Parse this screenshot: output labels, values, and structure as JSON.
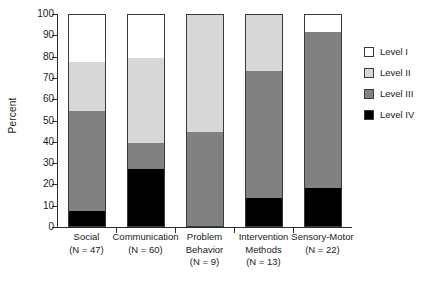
{
  "chart_data": {
    "type": "bar",
    "subtype": "stacked-bar-100",
    "title": "",
    "xlabel": "",
    "ylabel": "Percent",
    "ylim": [
      0,
      100
    ],
    "yticks": [
      0,
      10,
      20,
      30,
      40,
      50,
      60,
      70,
      80,
      90,
      100
    ],
    "grid": false,
    "legend_position": "right",
    "categories": [
      "Social",
      "Communication",
      "Problem Behavior",
      "Intervention Methods",
      "Sensory-Motor"
    ],
    "category_lines": [
      [
        "Social",
        "(N = 47)"
      ],
      [
        "Communication",
        "(N = 60)"
      ],
      [
        "Problem",
        "Behavior",
        "(N = 9)"
      ],
      [
        "Intervention",
        "Methods",
        "(N = 13)"
      ],
      [
        "Sensory-Motor",
        "(N = 22)"
      ]
    ],
    "category_counts": [
      47,
      60,
      9,
      13,
      22
    ],
    "series": [
      {
        "name": "Level I",
        "color": "#ffffff",
        "values": [
          23,
          21,
          0,
          0,
          9
        ]
      },
      {
        "name": "Level II",
        "color": "#d7d7d7",
        "values": [
          23,
          40,
          56,
          27,
          0
        ]
      },
      {
        "name": "Level III",
        "color": "#818181",
        "values": [
          47,
          12,
          44,
          60,
          73
        ]
      },
      {
        "name": "Level IV",
        "color": "#000000",
        "values": [
          7,
          27,
          0,
          13,
          18
        ]
      }
    ],
    "cumulative_tops": {
      "Level IV": [
        7,
        27,
        0,
        13,
        18
      ],
      "Level III": [
        54,
        39,
        44,
        73,
        91
      ],
      "Level II": [
        77,
        79,
        100,
        100,
        91
      ],
      "Level I": [
        100,
        100,
        100,
        100,
        100
      ]
    }
  },
  "legend": {
    "items": [
      {
        "label": "Level I",
        "swatch": "#ffffff"
      },
      {
        "label": "Level II",
        "swatch": "#d7d7d7"
      },
      {
        "label": "Level III",
        "swatch": "#818181"
      },
      {
        "label": "Level IV",
        "swatch": "#000000"
      }
    ]
  },
  "axis": {
    "y_label": "Percent",
    "y_ticks": [
      "0",
      "10",
      "20",
      "30",
      "40",
      "50",
      "60",
      "70",
      "80",
      "90",
      "100"
    ]
  }
}
